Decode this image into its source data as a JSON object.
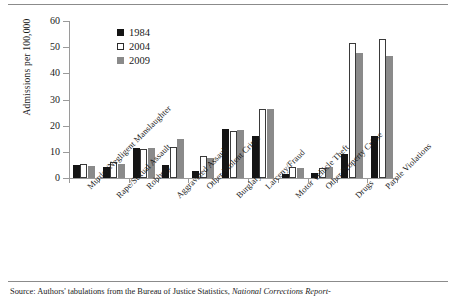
{
  "figure": {
    "source_note_prefix": "Source: Authors' tabulations from the Bureau of Justice Statistics, ",
    "source_note_italic": "National Corrections Report-"
  },
  "chart_data": {
    "type": "bar",
    "title": "",
    "xlabel": "",
    "ylabel": "Admissions per 100,000",
    "ylim": [
      0,
      60
    ],
    "yticks": [
      0,
      10,
      20,
      30,
      40,
      50,
      60
    ],
    "grid": false,
    "legend_position": "top-left",
    "categories": [
      "Murder/Negligent Manslaughter",
      "Rape/Sexual Assault",
      "Robbery",
      "Aggravated Assault",
      "Other Violent Crime",
      "Burglary",
      "Larceny/Fraud",
      "Motor Vehicle Theft",
      "Other Property Crime",
      "Drugs",
      "Parole Violations"
    ],
    "series": [
      {
        "name": "1984",
        "color": "#141414",
        "values": [
          5.0,
          4.2,
          11.3,
          5.0,
          2.5,
          18.9,
          16.1,
          1.7,
          1.8,
          9.1,
          15.9
        ]
      },
      {
        "name": "2004",
        "color": "#ffffff",
        "values": [
          5.5,
          6.3,
          11.2,
          11.9,
          8.5,
          17.9,
          26.5,
          4.4,
          3.8,
          51.6,
          53.2
        ]
      },
      {
        "name": "2009",
        "color": "#8a8a8a",
        "values": [
          4.7,
          5.3,
          11.4,
          15.0,
          7.8,
          18.5,
          26.5,
          3.9,
          4.4,
          47.6,
          46.7
        ]
      }
    ]
  }
}
